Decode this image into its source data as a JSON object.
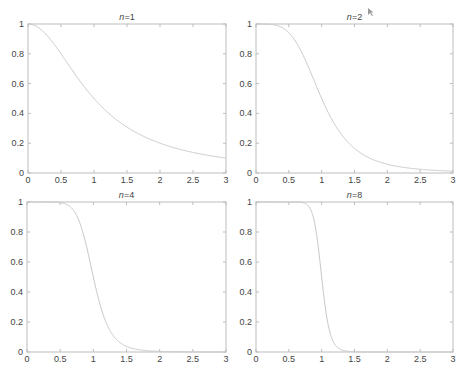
{
  "chart_data": [
    {
      "type": "line",
      "title": "n=1",
      "title_var": "n",
      "title_value": "=1",
      "function": "1/(1+x^(2n))",
      "n": 1,
      "xlabel": "",
      "ylabel": "",
      "xlim": [
        0,
        3
      ],
      "ylim": [
        0,
        1
      ],
      "xticks": [
        0,
        0.5,
        1,
        1.5,
        2,
        2.5,
        3
      ],
      "xtick_labels": [
        "0",
        "0.5",
        "1",
        "1.5",
        "2",
        "2.5",
        "3"
      ],
      "yticks": [
        0,
        0.2,
        0.4,
        0.6,
        0.8,
        1
      ],
      "ytick_labels": [
        "0",
        "0.2",
        "0.4",
        "0.6",
        "0.8",
        "1"
      ],
      "grid": false,
      "series": [
        {
          "name": "n=1",
          "x": [
            0,
            0.25,
            0.5,
            0.75,
            1,
            1.25,
            1.5,
            1.75,
            2,
            2.25,
            2.5,
            2.75,
            3
          ],
          "y": [
            1.0,
            0.941,
            0.8,
            0.64,
            0.5,
            0.39,
            0.308,
            0.246,
            0.2,
            0.165,
            0.138,
            0.117,
            0.1
          ]
        }
      ]
    },
    {
      "type": "line",
      "title": "n=2",
      "title_var": "n",
      "title_value": "=2",
      "function": "1/(1+x^(2n))",
      "n": 2,
      "xlabel": "",
      "ylabel": "",
      "xlim": [
        0,
        3
      ],
      "ylim": [
        0,
        1
      ],
      "xticks": [
        0,
        0.5,
        1,
        1.5,
        2,
        2.5,
        3
      ],
      "xtick_labels": [
        "0",
        "0.5",
        "1",
        "1.5",
        "2",
        "2.5",
        "3"
      ],
      "yticks": [
        0,
        0.2,
        0.4,
        0.6,
        0.8,
        1
      ],
      "ytick_labels": [
        "0",
        "0.2",
        "0.4",
        "0.6",
        "0.8",
        "1"
      ],
      "grid": false,
      "series": [
        {
          "name": "n=2",
          "x": [
            0,
            0.25,
            0.5,
            0.75,
            1,
            1.25,
            1.5,
            1.75,
            2,
            2.25,
            2.5,
            2.75,
            3
          ],
          "y": [
            1.0,
            0.996,
            0.941,
            0.76,
            0.5,
            0.29,
            0.165,
            0.101,
            0.059,
            0.038,
            0.025,
            0.017,
            0.012
          ]
        }
      ]
    },
    {
      "type": "line",
      "title": "n=4",
      "title_var": "n",
      "title_value": "=4",
      "function": "1/(1+x^(2n))",
      "n": 4,
      "xlabel": "",
      "ylabel": "",
      "xlim": [
        0,
        3
      ],
      "ylim": [
        0,
        1
      ],
      "xticks": [
        0,
        0.5,
        1,
        1.5,
        2,
        2.5,
        3
      ],
      "xtick_labels": [
        "0",
        "0.5",
        "1",
        "1.5",
        "2",
        "2.5",
        "3"
      ],
      "yticks": [
        0,
        0.2,
        0.4,
        0.6,
        0.8,
        1
      ],
      "ytick_labels": [
        "0",
        "0.2",
        "0.4",
        "0.6",
        "0.8",
        "1"
      ],
      "grid": false,
      "series": [
        {
          "name": "n=4",
          "x": [
            0,
            0.25,
            0.5,
            0.75,
            1,
            1.25,
            1.5,
            1.75,
            2,
            2.25,
            2.5,
            2.75,
            3
          ],
          "y": [
            1.0,
            1.0,
            0.996,
            0.909,
            0.5,
            0.144,
            0.038,
            0.011,
            0.004,
            0.0015,
            0.0007,
            0.0003,
            0.0002
          ]
        }
      ]
    },
    {
      "type": "line",
      "title": "n=8",
      "title_var": "n",
      "title_value": "=8",
      "function": "1/(1+x^(2n))",
      "n": 8,
      "xlabel": "",
      "ylabel": "",
      "xlim": [
        0,
        3
      ],
      "ylim": [
        0,
        1
      ],
      "xticks": [
        0,
        0.5,
        1,
        1.5,
        2,
        2.5,
        3
      ],
      "xtick_labels": [
        "0",
        "0.5",
        "1",
        "1.5",
        "2",
        "2.5",
        "3"
      ],
      "yticks": [
        0,
        0.2,
        0.4,
        0.6,
        0.8,
        1
      ],
      "ytick_labels": [
        "0",
        "0.2",
        "0.4",
        "0.6",
        "0.8",
        "1"
      ],
      "grid": false,
      "series": [
        {
          "name": "n=8",
          "x": [
            0,
            0.25,
            0.5,
            0.75,
            1,
            1.25,
            1.5,
            1.75,
            2,
            2.25,
            2.5,
            2.75,
            3
          ],
          "y": [
            1.0,
            1.0,
            1.0,
            0.99,
            0.5,
            0.028,
            0.0015,
            0.0001,
            0.0,
            0.0,
            0.0,
            0.0,
            0.0
          ]
        }
      ]
    }
  ],
  "colors": {
    "curve": "#c9c9c9",
    "axes": "#bdbdbd",
    "text": "#444444",
    "background": "#ffffff"
  }
}
